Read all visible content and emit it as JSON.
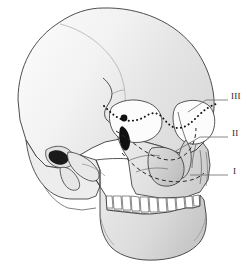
{
  "figure": {
    "name": "skull-lateral-oblique-le-fort-fracture-diagram",
    "background_color": "#ffffff",
    "outline_color": "#3a3a3a",
    "bone_fill_light": "#f0f0f0",
    "bone_fill_mid": "#d8d8d8",
    "bone_fill_dark": "#bdbdbd",
    "orbit_fill": "#fbfbfb",
    "teeth_fill": "#ffffff",
    "fracture_line_color": "#111111"
  },
  "labels": [
    {
      "id": "label-3",
      "text": "III",
      "x": 232,
      "y": 96,
      "leader": {
        "x1": 228,
        "y1": 100,
        "x2": 203,
        "y2": 100,
        "x3": 188,
        "y3": 112
      }
    },
    {
      "id": "label-2",
      "text": "II",
      "x": 233,
      "y": 133,
      "leader": {
        "x1": 228,
        "y1": 137,
        "x2": 200,
        "y2": 137,
        "x3": 176,
        "y3": 151
      }
    },
    {
      "id": "label-1",
      "text": "I",
      "x": 234,
      "y": 172,
      "leader": {
        "x1": 228,
        "y1": 175,
        "x2": 196,
        "y2": 175,
        "x3": 190,
        "y3": 175
      }
    }
  ],
  "fracture_lines": {
    "le_fort_3": "dotted line across naso-orbital and zygomatic arch region",
    "le_fort_2": "dashed pyramidal line across nasal bridge and maxilla",
    "le_fort_1": "dashed horizontal line above the maxillary teeth"
  }
}
